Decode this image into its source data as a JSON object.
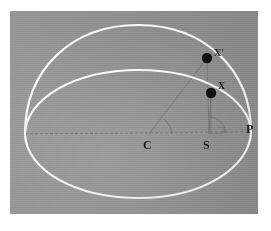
{
  "figure": {
    "kind": "geometric-astronomy-diagram",
    "background_color": "#8b8b8b",
    "frame_color": "#ffffff",
    "curve_color": "#f2f2f2",
    "construction_line_color": "#6f6f6f",
    "point_color": "#111111",
    "label_color": "#1a1a1a",
    "plate": {
      "x": 10,
      "y": 11,
      "width": 248,
      "height": 203
    }
  },
  "labels": {
    "center": "C",
    "focus": "S",
    "perihelion": "P",
    "point_on_circle": "X'",
    "point_on_ellipse": "X"
  },
  "points": {
    "C": {
      "x": 139,
      "y": 123
    },
    "S": {
      "x": 199,
      "y": 123
    },
    "P": {
      "x": 241,
      "y": 121
    },
    "X_prime": {
      "x": 197,
      "y": 47
    },
    "X": {
      "x": 201,
      "y": 82
    },
    "foot": {
      "x": 201,
      "y": 123
    },
    "left_vertex": {
      "x": 15,
      "y": 123
    }
  },
  "elements": {
    "outer_curve": "circle-arc",
    "inner_curve": "ellipse-arc",
    "axis": "dashed-major-axis",
    "radius_line": "C-to-X-prime",
    "focal_line": "S-to-X",
    "ordinate": "X-to-axis-perpendicular",
    "angle_mark_center": "eccentric-anomaly-arc",
    "angle_mark_focus": "true-anomaly-arc",
    "right_angle_mark": "perpendicular-square"
  }
}
